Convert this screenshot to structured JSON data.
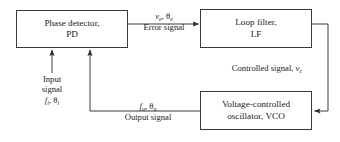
{
  "diagram": {
    "type": "block-diagram",
    "blocks": [
      {
        "id": "pd",
        "line1": "Phase detector,",
        "line2": "PD"
      },
      {
        "id": "lf",
        "line1": "Loop filter,",
        "line2": "LF"
      },
      {
        "id": "vco",
        "line1": "Voltage-controlled",
        "line2": "oscillator, VCO"
      }
    ],
    "labels": {
      "error_symbols_v": "v",
      "error_symbols_v_sub": "e",
      "error_symbols_sep": ", ",
      "error_symbols_theta": "θ",
      "error_symbols_theta_sub": "e",
      "error_text": "Error signal",
      "controlled_text": "Controlled signal, ",
      "controlled_symbol": "v",
      "controlled_symbol_sub": "c",
      "input_line1": "Input",
      "input_line2": "signal",
      "input_symbol_f": "f",
      "input_symbol_f_sub": "i",
      "input_sep": ", ",
      "input_symbol_theta": "θ",
      "input_symbol_theta_sub": "i",
      "output_symbol_f": "f",
      "output_symbol_f_sub": "o",
      "output_sep": ", ",
      "output_symbol_theta": "θ",
      "output_symbol_theta_sub": "o",
      "output_text": "Output signal"
    },
    "colors": {
      "stroke": "#3a3a3a",
      "text": "#1a1a1a",
      "background": "#ffffff"
    }
  }
}
